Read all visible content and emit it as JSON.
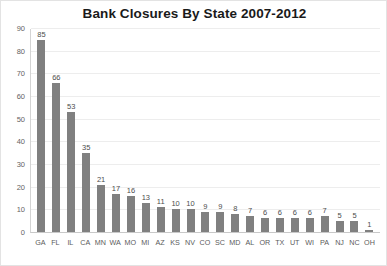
{
  "chart_data": {
    "type": "bar",
    "title": "Bank Closures By State 2007-2012",
    "xlabel": "",
    "ylabel": "",
    "ylim": [
      0,
      90
    ],
    "yticks": [
      0,
      10,
      20,
      30,
      40,
      50,
      60,
      70,
      80,
      90
    ],
    "grid": true,
    "legend": false,
    "bar_color": "#808080",
    "categories": [
      "GA",
      "FL",
      "IL",
      "CA",
      "MN",
      "WA",
      "MO",
      "MI",
      "AZ",
      "KS",
      "NV",
      "CO",
      "SC",
      "MD",
      "AL",
      "OR",
      "TX",
      "UT",
      "WI",
      "PA",
      "NJ",
      "NC",
      "OH"
    ],
    "values": [
      85,
      66,
      53,
      35,
      21,
      17,
      16,
      13,
      11,
      10,
      10,
      9,
      9,
      8,
      7,
      6,
      6,
      6,
      6,
      7,
      5,
      5,
      1
    ],
    "data_labels": [
      "85",
      "66",
      "53",
      "35",
      "21",
      "17",
      "16",
      "13",
      "11",
      "10",
      "10",
      "9",
      "9",
      "8",
      "7",
      "6",
      "6",
      "6",
      "6",
      "7",
      "5",
      "5",
      "1"
    ],
    "ytick_labels": [
      "0",
      "10",
      "20",
      "30",
      "40",
      "50",
      "60",
      "70",
      "80",
      "90"
    ]
  }
}
